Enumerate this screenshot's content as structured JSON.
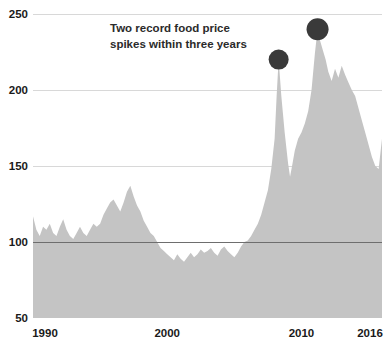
{
  "chart_data": {
    "type": "area",
    "title": "",
    "subtitle": "",
    "xlabel": "",
    "ylabel": "",
    "xlim": [
      1990,
      2016
    ],
    "ylim": [
      50,
      250
    ],
    "grid": true,
    "legend": "none",
    "series_name": "Food price index",
    "series_color": "#c4c4c4",
    "baseline_value": 50,
    "y_ticks": [
      50,
      100,
      150,
      200,
      250
    ],
    "y_tick_labels": [
      "50",
      "100",
      "150",
      "200",
      "250"
    ],
    "x_ticks": [
      1990,
      2000,
      2010,
      2016
    ],
    "x_tick_labels": [
      "1990",
      "2000",
      "2010",
      "2016"
    ],
    "gridline_color": "#d8d8d8",
    "emphasis_gridline_value": 100,
    "emphasis_gridline_color": "#6e6e6e",
    "annotations": [
      {
        "name": "spike-callout",
        "line1": "Two record food price",
        "line2": "spikes within three years",
        "color": "#2b2b2b"
      }
    ],
    "markers": [
      {
        "name": "spike-2008",
        "x": 2008.3,
        "y": 220,
        "color": "#3a3a3a",
        "radius": 10
      },
      {
        "name": "spike-2011",
        "x": 2011.2,
        "y": 240,
        "color": "#3a3a3a",
        "radius": 11
      }
    ],
    "x": [
      1990.0,
      1990.25,
      1990.5,
      1990.75,
      1991.0,
      1991.25,
      1991.5,
      1991.75,
      1992.0,
      1992.25,
      1992.5,
      1992.75,
      1993.0,
      1993.25,
      1993.5,
      1993.75,
      1994.0,
      1994.25,
      1994.5,
      1994.75,
      1995.0,
      1995.25,
      1995.5,
      1995.75,
      1996.0,
      1996.25,
      1996.5,
      1996.75,
      1997.0,
      1997.25,
      1997.5,
      1997.75,
      1998.0,
      1998.25,
      1998.5,
      1998.75,
      1999.0,
      1999.25,
      1999.5,
      1999.75,
      2000.0,
      2000.25,
      2000.5,
      2000.75,
      2001.0,
      2001.25,
      2001.5,
      2001.75,
      2002.0,
      2002.25,
      2002.5,
      2002.75,
      2003.0,
      2003.25,
      2003.5,
      2003.75,
      2004.0,
      2004.25,
      2004.5,
      2004.75,
      2005.0,
      2005.25,
      2005.5,
      2005.75,
      2006.0,
      2006.25,
      2006.5,
      2006.75,
      2007.0,
      2007.25,
      2007.5,
      2007.75,
      2008.0,
      2008.15,
      2008.3,
      2008.5,
      2008.75,
      2009.0,
      2009.15,
      2009.3,
      2009.5,
      2009.75,
      2010.0,
      2010.25,
      2010.5,
      2010.75,
      2011.0,
      2011.2,
      2011.4,
      2011.6,
      2011.8,
      2012.0,
      2012.25,
      2012.5,
      2012.75,
      2013.0,
      2013.25,
      2013.5,
      2013.75,
      2014.0,
      2014.25,
      2014.5,
      2014.75,
      2015.0,
      2015.25,
      2015.5,
      2015.75,
      2016.0
    ],
    "values": [
      117,
      108,
      104,
      110,
      108,
      112,
      106,
      104,
      110,
      115,
      108,
      104,
      102,
      106,
      110,
      106,
      104,
      108,
      112,
      110,
      112,
      118,
      122,
      126,
      128,
      124,
      120,
      126,
      133,
      137,
      130,
      124,
      120,
      114,
      110,
      106,
      104,
      100,
      96,
      94,
      92,
      90,
      88,
      92,
      89,
      87,
      90,
      93,
      90,
      92,
      95,
      93,
      94,
      96,
      93,
      91,
      95,
      97,
      94,
      92,
      90,
      93,
      97,
      100,
      101,
      104,
      108,
      112,
      118,
      126,
      134,
      148,
      168,
      196,
      220,
      196,
      172,
      152,
      143,
      150,
      160,
      168,
      172,
      178,
      186,
      200,
      224,
      240,
      232,
      226,
      220,
      212,
      206,
      214,
      208,
      216,
      210,
      205,
      200,
      196,
      188,
      180,
      172,
      164,
      156,
      150,
      148,
      168
    ]
  }
}
